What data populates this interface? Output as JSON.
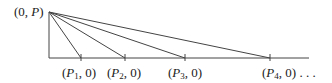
{
  "diagram": {
    "apex": {
      "label_open": "(0, ",
      "label_var": "P",
      "label_close": ")",
      "x": 49,
      "y": 12
    },
    "baseline": {
      "x1": 49,
      "x2": 309,
      "y": 58
    },
    "points": [
      {
        "var": "P",
        "sub": "1",
        "tail": ", 0)",
        "x": 81
      },
      {
        "var": "P",
        "sub": "2",
        "tail": ", 0)",
        "x": 125
      },
      {
        "var": "P",
        "sub": "3",
        "tail": ", 0)",
        "x": 185
      },
      {
        "var": "P",
        "sub": "4",
        "tail": ", 0) . . .",
        "x": 270
      }
    ],
    "line_color": "#444444"
  }
}
